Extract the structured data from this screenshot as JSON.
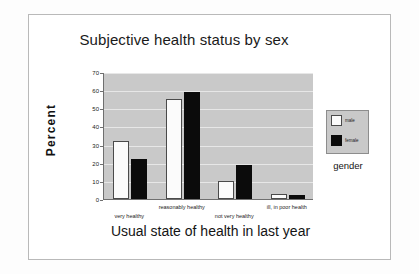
{
  "chart_data": {
    "type": "bar",
    "title": "Subjective health status by sex",
    "xlabel": "Usual state of health in last year",
    "ylabel": "Percent",
    "ylim": [
      0,
      70
    ],
    "yticks": [
      0,
      10,
      20,
      30,
      40,
      50,
      60,
      70
    ],
    "grid": true,
    "legend_position": "right",
    "legend_title": "gender",
    "categories": [
      "very healthy",
      "reasonably healthy",
      "not very healthy",
      "ill, in poor health"
    ],
    "series": [
      {
        "name": "male",
        "color": "#ffffff",
        "values": [
          32,
          55,
          10,
          3
        ]
      },
      {
        "name": "female",
        "color": "#000000",
        "values": [
          22,
          59,
          19,
          2
        ]
      }
    ]
  },
  "legend": {
    "entries": [
      {
        "label": "male"
      },
      {
        "label": "female"
      }
    ],
    "title": "gender"
  }
}
